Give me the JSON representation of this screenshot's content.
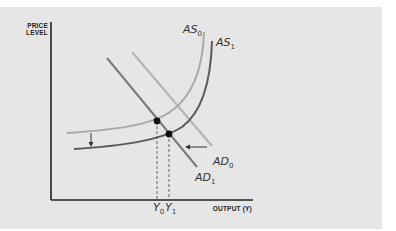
{
  "diagram": {
    "type": "AS-AD shift diagram",
    "y_axis_label_line1": "PRICE",
    "y_axis_label_line2": "LEVEL",
    "x_axis_label": "OUTPUT (Y)",
    "curves": [
      {
        "id": "AS0",
        "label_main": "AS",
        "label_sub": "0",
        "color": "#a8a8a8"
      },
      {
        "id": "AS1",
        "label_main": "AS",
        "label_sub": "1",
        "color": "#5a5a5a"
      },
      {
        "id": "AD0",
        "label_main": "AD",
        "label_sub": "0",
        "color": "#b4b4b4"
      },
      {
        "id": "AD1",
        "label_main": "AD",
        "label_sub": "1",
        "color": "#6e6e6e"
      }
    ],
    "equilibria": [
      {
        "id": "E0",
        "x_label_main": "Y",
        "x_label_sub": "0"
      },
      {
        "id": "E1",
        "x_label_main": "Y",
        "x_label_sub": "1"
      }
    ],
    "arrows": [
      {
        "id": "as-shift-arrow",
        "direction": "down"
      },
      {
        "id": "ad-shift-arrow",
        "direction": "left"
      }
    ],
    "colors": {
      "panel_background": "#e6e6e6",
      "axis": "#222222",
      "point": "#111111"
    }
  }
}
